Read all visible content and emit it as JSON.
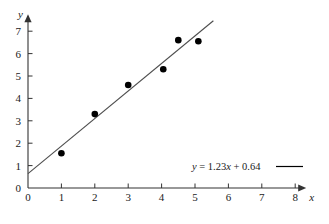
{
  "chart_data": {
    "type": "scatter",
    "title": "",
    "subtitle": "",
    "xlabel": "x",
    "ylabel": "y",
    "xlim": [
      0,
      8
    ],
    "ylim": [
      0,
      7
    ],
    "grid": false,
    "x_ticks": [
      "0",
      "1",
      "2",
      "3",
      "4",
      "5",
      "6",
      "7",
      "8"
    ],
    "y_ticks": [
      "0",
      "1",
      "2",
      "3",
      "4",
      "5",
      "6",
      "7"
    ],
    "x_tick_values": [
      0,
      1,
      2,
      3,
      4,
      5,
      6,
      7,
      8
    ],
    "y_tick_values": [
      0,
      1,
      2,
      3,
      4,
      5,
      6,
      7
    ],
    "points": [
      {
        "x": 1.0,
        "y": 1.55
      },
      {
        "x": 2.0,
        "y": 3.3
      },
      {
        "x": 3.0,
        "y": 4.6
      },
      {
        "x": 4.05,
        "y": 5.3
      },
      {
        "x": 4.5,
        "y": 6.6
      },
      {
        "x": 5.1,
        "y": 6.55
      }
    ],
    "fit_line": {
      "slope": 1.23,
      "intercept": 0.64,
      "x_start": 0,
      "x_end": 5.55
    },
    "legend": {
      "position": "inside-bottom-right",
      "entries": [
        {
          "label_prefix": "y",
          "label_body": " = 1.23",
          "label_var": "x",
          "label_suffix": " + 0.64",
          "full_label": "y = 1.23x + 0.64",
          "marker": "line"
        }
      ]
    },
    "colors": {
      "axis": "#333333",
      "point": "#000000",
      "line": "#4d4d4d",
      "text": "#1a1a1a",
      "background": "#ffffff"
    }
  },
  "axes": {
    "y_axis_label": "y",
    "x_axis_label": "x"
  }
}
